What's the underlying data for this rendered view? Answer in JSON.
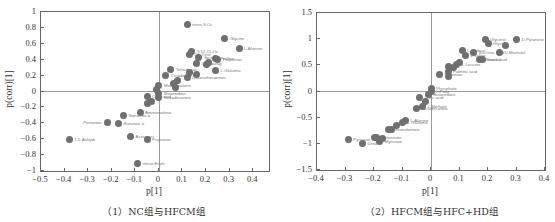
{
  "chart_data": [
    {
      "type": "scatter",
      "title": "",
      "caption": "（1）NC组与HFCM组",
      "xlabel": "p[1]",
      "ylabel": "p(corr)[1]",
      "xlim": [
        -0.5,
        0.47
      ],
      "ylim": [
        -1,
        1
      ],
      "xticks": [
        "-0.5",
        "-0.4",
        "-0.3",
        "-0.2",
        "-0.1",
        "0",
        "0.1",
        "0.2",
        "0.3",
        "0.4"
      ],
      "yticks": [
        "1",
        "0.8",
        "0.6",
        "0.4",
        "0.2",
        "0",
        "-0.2",
        "-0.4",
        "-0.6",
        "-0.8",
        "-1"
      ],
      "grid": false,
      "points": [
        {
          "x": 0.12,
          "y": 0.84,
          "label": "trans-9-Oc"
        },
        {
          "x": 0.28,
          "y": 0.67,
          "label": "Glycine"
        },
        {
          "x": 0.34,
          "y": 0.54,
          "label": "L-Alanine"
        },
        {
          "x": 0.14,
          "y": 0.5,
          "label": "9,12,15-Oc"
        },
        {
          "x": 0.13,
          "y": 0.47,
          "label": "DL-Ornit"
        },
        {
          "x": 0.17,
          "y": 0.43,
          "label": "Serine"
        },
        {
          "x": 0.24,
          "y": 0.42,
          "label": "Proline"
        },
        {
          "x": 0.25,
          "y": 0.4,
          "label": "Propanoic"
        },
        {
          "x": 0.21,
          "y": 0.37,
          "label": ""
        },
        {
          "x": 0.16,
          "y": 0.35,
          "label": "L-Asparag"
        },
        {
          "x": 0.2,
          "y": 0.34,
          "label": ""
        },
        {
          "x": 0.05,
          "y": 0.28,
          "label": "Tetradecan"
        },
        {
          "x": 0.24,
          "y": 0.27,
          "label": "L-Glutamic"
        },
        {
          "x": 0.13,
          "y": 0.24,
          "label": ""
        },
        {
          "x": 0.16,
          "y": 0.22,
          "label": ""
        },
        {
          "x": 0.03,
          "y": 0.2,
          "label": "Octadecan"
        },
        {
          "x": 0.12,
          "y": 0.18,
          "label": "Docosahexaenoic"
        },
        {
          "x": 0.08,
          "y": 0.14,
          "label": ""
        },
        {
          "x": 0.06,
          "y": 0.1,
          "label": ""
        },
        {
          "x": 0.0,
          "y": 0.08,
          "label": "Methylmalonic"
        },
        {
          "x": 0.07,
          "y": 0.05,
          "label": ""
        },
        {
          "x": -0.01,
          "y": 0.02,
          "label": ""
        },
        {
          "x": 0.0,
          "y": -0.02,
          "label": "Butanedioic"
        },
        {
          "x": -0.05,
          "y": -0.06,
          "label": "Citric acid"
        },
        {
          "x": 0.0,
          "y": -0.08,
          "label": "Hexadecanoic"
        },
        {
          "x": -0.03,
          "y": -0.12,
          "label": ""
        },
        {
          "x": -0.05,
          "y": -0.15,
          "label": ""
        },
        {
          "x": -0.08,
          "y": -0.26,
          "label": "Aminomalonic"
        },
        {
          "x": -0.15,
          "y": -0.3,
          "label": "Nonanoic a"
        },
        {
          "x": -0.22,
          "y": -0.39,
          "label": "Pentanoic"
        },
        {
          "x": -0.17,
          "y": -0.4,
          "label": "Butanoic a"
        },
        {
          "x": -0.38,
          "y": -0.6,
          "label": "1,5-Anhydr"
        },
        {
          "x": -0.12,
          "y": -0.56,
          "label": "Acetic aci"
        },
        {
          "x": -0.05,
          "y": -0.6,
          "label": "Propanoic"
        },
        {
          "x": -0.09,
          "y": -0.9,
          "label": "meso-Eryth"
        }
      ]
    },
    {
      "type": "scatter",
      "title": "",
      "caption": "（2）HFCM组与HFC+HD组",
      "xlabel": "p[1]",
      "ylabel": "p(corr)[1]",
      "xlim": [
        -0.4,
        0.4
      ],
      "ylim": [
        -1.5,
        1.5
      ],
      "xticks": [
        "-0.4",
        "-0.3",
        "-0.2",
        "-0.1",
        "0",
        "0.1",
        "0.2",
        "0.3",
        "0.4"
      ],
      "yticks": [
        "1.5",
        "1",
        "0.5",
        "0",
        "-0.5",
        "-1",
        "-1.5"
      ],
      "grid": false,
      "points": [
        {
          "x": 0.3,
          "y": 1.0,
          "label": "D-Pyranose"
        },
        {
          "x": 0.19,
          "y": 0.99,
          "label": "Glycerol"
        },
        {
          "x": 0.2,
          "y": 0.92,
          "label": "Glycine"
        },
        {
          "x": 0.26,
          "y": 0.88,
          "label": ""
        },
        {
          "x": 0.11,
          "y": 0.79,
          "label": "L-Isoleuci"
        },
        {
          "x": 0.15,
          "y": 0.74,
          "label": "Succinic acid"
        },
        {
          "x": 0.24,
          "y": 0.75,
          "label": "D-Mannitol"
        },
        {
          "x": 0.12,
          "y": 0.68,
          "label": "L-Valine"
        },
        {
          "x": 0.18,
          "y": 0.62,
          "label": "Inositol"
        },
        {
          "x": 0.17,
          "y": 0.62,
          "label": "Stearic acid"
        },
        {
          "x": 0.1,
          "y": 0.56,
          "label": ""
        },
        {
          "x": 0.09,
          "y": 0.52,
          "label": "L-Leucine"
        },
        {
          "x": 0.06,
          "y": 0.48,
          "label": ""
        },
        {
          "x": 0.08,
          "y": 0.45,
          "label": ""
        },
        {
          "x": 0.06,
          "y": 0.38,
          "label": "Palmitic acid"
        },
        {
          "x": 0.03,
          "y": 0.33,
          "label": "Palmitate"
        },
        {
          "x": 0.06,
          "y": 0.28,
          "label": ""
        },
        {
          "x": 0.0,
          "y": 0.05,
          "label": "Phosphate"
        },
        {
          "x": 0.0,
          "y": 0.0,
          "label": "L-Prop"
        },
        {
          "x": -0.01,
          "y": -0.05,
          "label": "Butanedioic"
        },
        {
          "x": -0.04,
          "y": -0.12,
          "label": "Oleic acid"
        },
        {
          "x": -0.02,
          "y": -0.2,
          "label": ""
        },
        {
          "x": -0.03,
          "y": -0.28,
          "label": "L-Methion"
        },
        {
          "x": -0.05,
          "y": -0.32,
          "label": "Octadecanoic"
        },
        {
          "x": -0.09,
          "y": -0.55,
          "label": "L-Alanine"
        },
        {
          "x": -0.1,
          "y": -0.6,
          "label": "L-Glutamic"
        },
        {
          "x": -0.12,
          "y": -0.65,
          "label": ""
        },
        {
          "x": -0.15,
          "y": -0.72,
          "label": "Ethanolamine"
        },
        {
          "x": -0.14,
          "y": -0.73,
          "label": ""
        },
        {
          "x": -0.29,
          "y": -0.92,
          "label": "Pyruvate"
        },
        {
          "x": -0.2,
          "y": -0.88,
          "label": ""
        },
        {
          "x": -0.19,
          "y": -0.87,
          "label": "Butanoate"
        },
        {
          "x": -0.17,
          "y": -0.89,
          "label": ""
        },
        {
          "x": -0.24,
          "y": -0.99,
          "label": "Urea"
        },
        {
          "x": -0.18,
          "y": -0.95,
          "label": "Myristate"
        }
      ]
    }
  ]
}
